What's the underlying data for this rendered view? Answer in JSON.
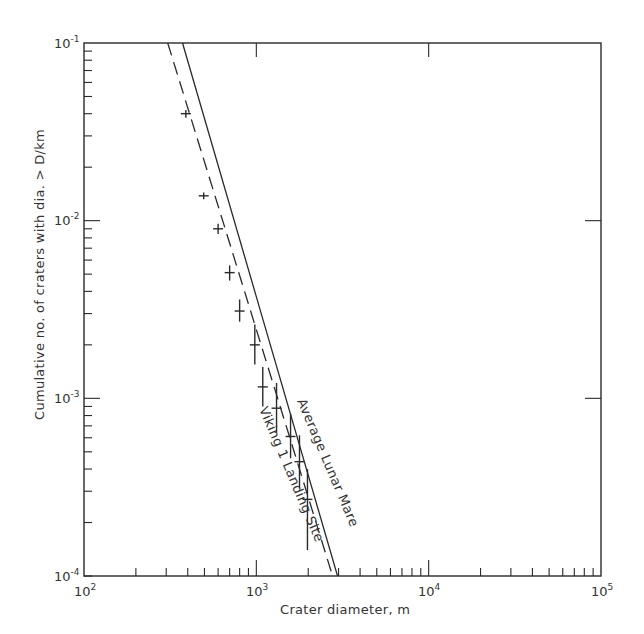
{
  "chart_data": {
    "type": "line",
    "title": "",
    "xlabel": "Crater diameter, m",
    "ylabel": "Cumulative no. of craters with dia. > D/km",
    "xscale": "log",
    "yscale": "log",
    "xlim": [
      100,
      100000
    ],
    "ylim": [
      0.0001,
      0.1
    ],
    "x_ticks": [
      {
        "value": 100,
        "base": "10",
        "exp": "2"
      },
      {
        "value": 1000,
        "base": "10",
        "exp": "3"
      },
      {
        "value": 10000,
        "base": "10",
        "exp": "4"
      },
      {
        "value": 100000,
        "base": "10",
        "exp": "5"
      }
    ],
    "y_ticks": [
      {
        "value": 0.1,
        "base": "10",
        "exp": "-1"
      },
      {
        "value": 0.01,
        "base": "10",
        "exp": "-2"
      },
      {
        "value": 0.001,
        "base": "10",
        "exp": "-3"
      },
      {
        "value": 0.0001,
        "base": "10",
        "exp": "-4"
      }
    ],
    "grid": false,
    "legend": "inline labels along lines",
    "series": [
      {
        "name": "Average Lunar Mare",
        "style": "solid",
        "x": [
          373,
          2960
        ],
        "y": [
          0.1,
          0.0001
        ]
      },
      {
        "name": "Viking 1 Landing Site",
        "style": "dashed",
        "x": [
          306,
          2770
        ],
        "y": [
          0.1,
          0.0001
        ]
      },
      {
        "name": "Viking 1 Landing Site (observed)",
        "style": "points-with-error-bars",
        "x": [
          390,
          495,
          600,
          700,
          800,
          980,
          1090,
          1310,
          1580,
          1780,
          1980
        ],
        "y": [
          0.04,
          0.0138,
          0.009,
          0.0051,
          0.0031,
          0.002,
          0.00116,
          0.00088,
          0.00061,
          0.00044,
          0.00027
        ],
        "y_err_low": [
          0.038,
          0.0132,
          0.0084,
          0.0046,
          0.0027,
          0.00155,
          0.0009,
          0.00064,
          0.00046,
          0.00031,
          0.00014
        ],
        "y_err_high": [
          0.042,
          0.0144,
          0.0096,
          0.0056,
          0.0036,
          0.0026,
          0.0015,
          0.00122,
          0.00082,
          0.00062,
          0.0004
        ]
      }
    ],
    "annotations": [
      "Average Lunar Mare",
      "Viking 1 Landing Site"
    ]
  },
  "labels": {
    "xlabel": "Crater diameter, m",
    "ylabel": "Cumulative no. of craters with dia. > D/km",
    "series_solid": "Average Lunar Mare",
    "series_dashed": "Viking 1 Landing Site",
    "x_ticks": [
      {
        "base": "10",
        "exp": "2"
      },
      {
        "base": "10",
        "exp": "3"
      },
      {
        "base": "10",
        "exp": "4"
      },
      {
        "base": "10",
        "exp": "5"
      }
    ],
    "y_ticks": [
      {
        "base": "10",
        "exp": "-1"
      },
      {
        "base": "10",
        "exp": "-2"
      },
      {
        "base": "10",
        "exp": "-3"
      },
      {
        "base": "10",
        "exp": "-4"
      }
    ]
  },
  "colors": {
    "ink": "#2a2a2a",
    "background": "#ffffff"
  }
}
